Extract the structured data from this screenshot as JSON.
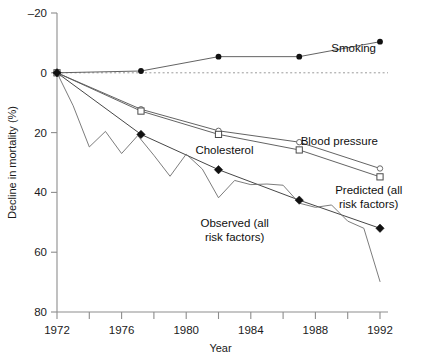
{
  "chart_data": {
    "type": "line",
    "title": "",
    "xlabel": "Year",
    "ylabel": "Decline in mortality (%)",
    "xlim": [
      1972,
      1992
    ],
    "ylim": [
      -20,
      80
    ],
    "y_inverted": true,
    "grid": false,
    "legend_position": "inline-annotations",
    "x_tick_labels": [
      "1972",
      "1976",
      "1980",
      "1984",
      "1988",
      "1992"
    ],
    "x_tick_values": [
      1972,
      1976,
      1980,
      1984,
      1988,
      1992
    ],
    "x_minor_tick_values": [
      1974,
      1978,
      1982,
      1986,
      1990
    ],
    "y_tick_labels": [
      "–20",
      "0",
      "20",
      "40",
      "60",
      "80"
    ],
    "y_tick_values": [
      -20,
      0,
      20,
      40,
      60,
      80
    ],
    "zero_reference_line": 0,
    "series": [
      {
        "name": "Smoking",
        "marker": "filled-circle",
        "x": [
          1972,
          1977.2,
          1982,
          1987,
          1992
        ],
        "values": [
          0,
          -0.6,
          -5.4,
          -5.4,
          -10.4
        ]
      },
      {
        "name": "Cholesterol",
        "marker": "open-circle",
        "x": [
          1972,
          1977.2,
          1982,
          1987,
          1992
        ],
        "values": [
          0,
          12.2,
          19.4,
          23.2,
          32.0
        ]
      },
      {
        "name": "Blood pressure",
        "marker": "open-square",
        "x": [
          1972,
          1977.2,
          1982,
          1987,
          1992
        ],
        "values": [
          0,
          12.8,
          20.6,
          25.8,
          34.8
        ]
      },
      {
        "name": "Predicted (all risk factors)",
        "marker": "filled-diamond",
        "x": [
          1972,
          1977.2,
          1982,
          1987,
          1992
        ],
        "values": [
          0,
          20.6,
          32.4,
          42.6,
          52.0
        ]
      },
      {
        "name": "Observed (all risk factors)",
        "marker": "none",
        "x": [
          1972,
          1973,
          1974,
          1975,
          1976,
          1977,
          1978,
          1979,
          1980,
          1981,
          1982,
          1983,
          1984,
          1985,
          1986,
          1987,
          1988,
          1989,
          1990,
          1991,
          1992
        ],
        "values": [
          0,
          11.0,
          24.8,
          19.6,
          27.0,
          21.0,
          27.6,
          34.6,
          27.2,
          32.2,
          41.8,
          36.0,
          37.4,
          37.2,
          37.6,
          43.6,
          45.0,
          44.2,
          49.6,
          52.0,
          69.8
        ]
      }
    ],
    "annotations": [
      {
        "text": "Smoking",
        "x": 1992,
        "y": -6.8,
        "anchor": "end",
        "dx": -4,
        "dy": 0
      },
      {
        "text": "Cholesterol",
        "x": 1982,
        "y": 27.0,
        "anchor": "middle",
        "dx": 6,
        "dy": 0
      },
      {
        "text": "Blood pressure",
        "x": 1992,
        "y": 24.0,
        "anchor": "end",
        "dx": -2,
        "dy": 0
      }
    ],
    "multiline_annotations": [
      {
        "lines": [
          "Predicted (all",
          "risk factors)"
        ],
        "x": 1991.3,
        "y": 40.5,
        "anchor": "middle"
      },
      {
        "lines": [
          "Observed (all",
          "risk factors)"
        ],
        "x": 1983.0,
        "y": 51.5,
        "anchor": "middle"
      }
    ]
  }
}
